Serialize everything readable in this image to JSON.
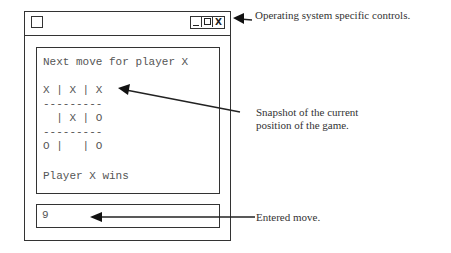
{
  "window": {
    "controls": {
      "minimize": "_",
      "maximize": "□",
      "close": "X"
    },
    "display": {
      "prompt": "Next move for player X",
      "board": [
        "X | X | X",
        "---------",
        "  | X | O",
        "---------",
        "O |   | O"
      ],
      "result": "Player X wins"
    },
    "input": {
      "value": "9"
    }
  },
  "annotations": {
    "controls_note": "Operating system specific controls.",
    "snapshot_note_line1": "Snapshot of the current",
    "snapshot_note_line2": "position of the game.",
    "input_note": "Entered move."
  }
}
